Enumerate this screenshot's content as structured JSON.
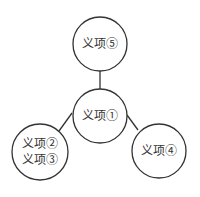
{
  "diagram": {
    "type": "tree",
    "colors": {
      "stroke": "#333333",
      "fill": "#ffffff",
      "text": "#333333"
    },
    "nodes": [
      {
        "id": "n1",
        "label": "义项①",
        "cx": 100,
        "cy": 116,
        "r": 27
      },
      {
        "id": "n5",
        "label": "义项⑤",
        "cx": 100,
        "cy": 44,
        "r": 27
      },
      {
        "id": "n23",
        "label_line1": "义项②",
        "label_line2": "义项③",
        "cx": 40,
        "cy": 152,
        "r": 28
      },
      {
        "id": "n4",
        "label": "义项④",
        "cx": 159,
        "cy": 151,
        "r": 27
      }
    ],
    "edges": [
      {
        "from": "n1",
        "to": "n5",
        "x1": 100,
        "y1": 89,
        "x2": 100,
        "y2": 71
      },
      {
        "from": "n1",
        "to": "n23",
        "x1": 72,
        "y1": 113,
        "x2": 59,
        "y2": 131
      },
      {
        "from": "n1",
        "to": "n4",
        "x1": 127,
        "y1": 115,
        "x2": 138,
        "y2": 130
      }
    ]
  }
}
